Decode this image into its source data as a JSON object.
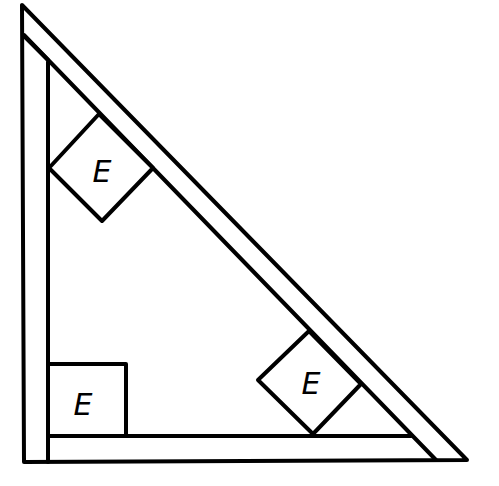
{
  "diagram": {
    "line_color": "#000000",
    "background": "#ffffff",
    "blocks": [
      {
        "id": "upper-diamond",
        "label": "E",
        "orientation": "rotated-45"
      },
      {
        "id": "lower-diamond",
        "label": "E",
        "orientation": "rotated-45"
      },
      {
        "id": "corner-square",
        "label": "E",
        "orientation": "upright"
      }
    ]
  }
}
